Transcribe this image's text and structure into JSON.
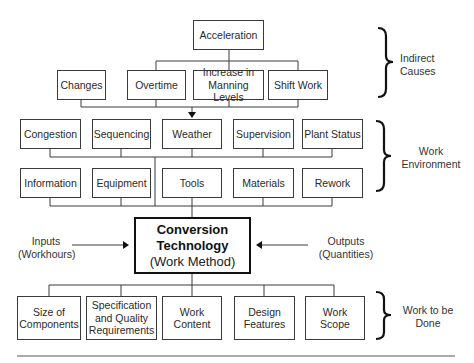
{
  "diagram": {
    "indirect_causes": {
      "top": "Acceleration",
      "items": [
        "Changes",
        "Overtime",
        "Increase in Manning Levels",
        "Shift Work"
      ],
      "group_label": "Indirect Causes"
    },
    "work_environment": {
      "row1": [
        "Congestion",
        "Sequencing",
        "Weather",
        "Supervision",
        "Plant Status"
      ],
      "row2": [
        "Information",
        "Equipment",
        "Tools",
        "Materials",
        "Rework"
      ],
      "group_label": "Work Environment"
    },
    "center": {
      "title_line1": "Conversion",
      "title_line2": "Technology",
      "subtitle": "(Work Method)"
    },
    "inputs": {
      "line1": "Inputs",
      "line2": "(Workhours)"
    },
    "outputs": {
      "line1": "Outputs",
      "line2": "(Quantities)"
    },
    "work_to_be_done": {
      "items": [
        "Size of Components",
        "Specification and Quality Requirements",
        "Work Content",
        "Design Features",
        "Work Scope"
      ],
      "group_label": "Work to be Done"
    }
  }
}
